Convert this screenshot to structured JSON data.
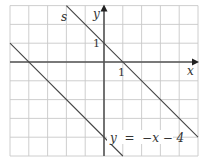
{
  "diagram": {
    "type": "coordinate-grid",
    "grid": {
      "x_range": [
        -5,
        5
      ],
      "y_range": [
        -5,
        3
      ],
      "grid_color": "#c8c8c8",
      "axis_color": "#555555",
      "line_color": "#444444"
    },
    "axes": {
      "x_label": "x",
      "y_label": "y",
      "x_tick_label": "1",
      "y_tick_label": "1"
    },
    "lines": [
      {
        "name": "s",
        "label": "s",
        "slope": -1,
        "intercept": 1
      },
      {
        "name": "given",
        "label": "y  =  −x − 4",
        "slope": -1,
        "intercept": -4
      }
    ]
  }
}
